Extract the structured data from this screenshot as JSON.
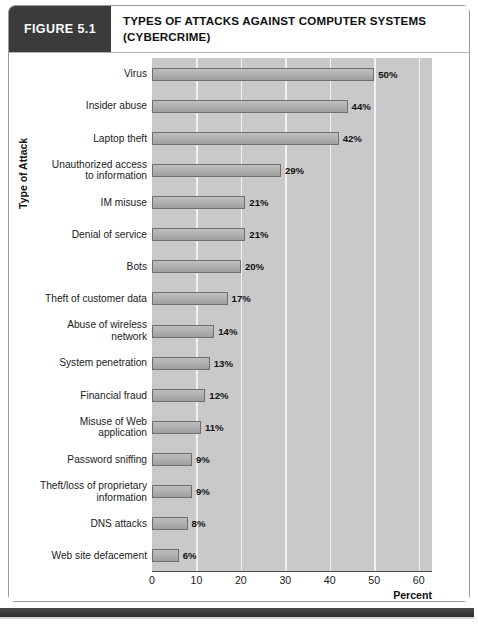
{
  "figure": {
    "tag": "FIGURE 5.1",
    "title": "TYPES OF ATTACKS AGAINST COMPUTER SYSTEMS (CYBERCRIME)",
    "title_line1": "TYPES OF ATTACKS AGAINST COMPUTER SYSTEMS",
    "title_line2": "(CYBERCRIME)"
  },
  "chart_data": {
    "type": "bar",
    "orientation": "horizontal",
    "title": "Types of Attacks Against Computer Systems (Cybercrime)",
    "xlabel": "Percent",
    "ylabel": "Type of Attack",
    "xlim": [
      0,
      63
    ],
    "xticks": [
      0,
      10,
      20,
      30,
      40,
      50,
      60
    ],
    "xtick_labels": [
      "0",
      "10",
      "20",
      "30",
      "40",
      "50",
      "60"
    ],
    "grid": "vertical",
    "legend": "none",
    "value_suffix": "%",
    "categories": [
      "Virus",
      "Insider abuse",
      "Laptop theft",
      "Unauthorized access\nto information",
      "IM misuse",
      "Denial of service",
      "Bots",
      "Theft of customer data",
      "Abuse of wireless\nnetwork",
      "System penetration",
      "Financial fraud",
      "Misuse of Web\napplication",
      "Password sniffing",
      "Theft/loss of proprietary\ninformation",
      "DNS attacks",
      "Web site defacement"
    ],
    "values": [
      50,
      44,
      42,
      29,
      21,
      21,
      20,
      17,
      14,
      13,
      12,
      11,
      9,
      9,
      8,
      6
    ],
    "data_labels": [
      "50%",
      "44%",
      "42%",
      "29%",
      "21%",
      "21%",
      "20%",
      "17%",
      "14%",
      "13%",
      "12%",
      "11%",
      "9%",
      "9%",
      "8%",
      "6%"
    ]
  },
  "colors": {
    "tag_background": "#3b3b3b",
    "plot_background": "#c9c9c9",
    "bar_fill": "#b2b2b2",
    "bar_border": "#6f6f6f",
    "gridline": "#f1f1f1",
    "frame_border": "#9a9a9a",
    "bottom_strip": "#3a3a3a"
  }
}
